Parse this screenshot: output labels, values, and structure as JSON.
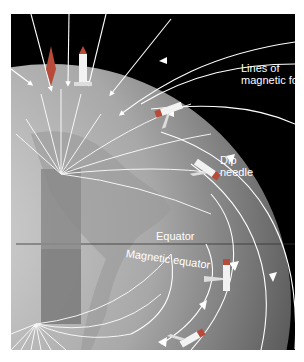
{
  "figure": {
    "labels": {
      "lines_of_force": "Lines of\nmagnetic force",
      "lines_of_force_line1": "Lines of",
      "lines_of_force_line2": "magnetic force",
      "dip_needle_line1": "Dip",
      "dip_needle_line2": "needle",
      "equator": "Equator",
      "magnetic_equator": "Magnetic equator"
    },
    "colors": {
      "background": "#000000",
      "globe_light": "#c8c8c8",
      "globe_dark": "#5a5a5a",
      "field_lines": "#ffffff",
      "needle_red": "#b84a3a",
      "needle_white": "#f2f2f2",
      "magnet_bar": "#8a8a8a"
    },
    "icons": [
      "compass-needle-icon",
      "dip-needle-icon",
      "field-arrow-icon"
    ]
  }
}
